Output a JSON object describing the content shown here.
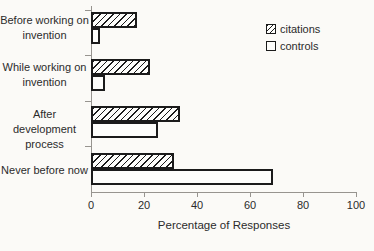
{
  "chart_data": {
    "type": "bar",
    "orientation": "horizontal",
    "title": "",
    "xlabel": "Percentage of Responses",
    "ylabel": "",
    "xlim": [
      0,
      100
    ],
    "xticks": [
      0,
      20,
      40,
      60,
      80,
      100
    ],
    "xtick_labels": [
      "0",
      "20",
      "40",
      "60",
      "80",
      "100"
    ],
    "categories": [
      "Before working on invention",
      "While working on invention",
      "After development process",
      "Never before now"
    ],
    "categories_display": [
      "Before working on\ninvention",
      "While working on\ninvention",
      "After development\nprocess",
      "Never before now"
    ],
    "series": [
      {
        "name": "citations",
        "pattern": "hatch",
        "values": [
          17,
          22,
          33,
          31
        ]
      },
      {
        "name": "controls",
        "pattern": "plain",
        "values": [
          3,
          5,
          25,
          68
        ]
      }
    ],
    "legend": {
      "position": "top-right",
      "items": [
        "citations",
        "controls"
      ]
    },
    "grid": false
  },
  "colors": {
    "background": "#fbfaf7",
    "ink": "#2b2b2b",
    "axis": "#97948f",
    "bar_outline": "#1b1b1b",
    "bar_fill": "#fdfdfb"
  }
}
